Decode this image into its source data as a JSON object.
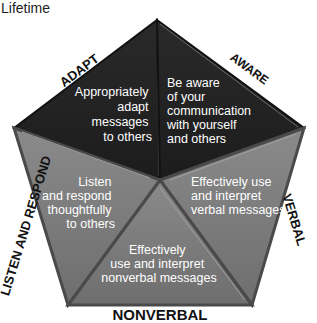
{
  "title": "Lifetime",
  "colors": {
    "dark_segment": "#222222",
    "grey_segment": "#7d7d7d",
    "edge_shadow": "#4a4a4a",
    "segment_text": "#ffffff",
    "label_text": "#111111"
  },
  "segments": [
    {
      "id": "adapt",
      "edge_label": "ADAPT",
      "text_lines": [
        "Appropriately",
        "adapt",
        "messages",
        "to others"
      ]
    },
    {
      "id": "aware",
      "edge_label": "AWARE",
      "text_lines": [
        "Be aware",
        "of your",
        "communication",
        "with yourself",
        "and others"
      ]
    },
    {
      "id": "verbal",
      "edge_label": "VERBAL",
      "text_lines": [
        "Effectively use",
        "and interpret",
        "verbal messages"
      ]
    },
    {
      "id": "nonverbal",
      "edge_label": "NONVERBAL",
      "text_lines": [
        "Effectively",
        "use and interpret",
        "nonverbal messages"
      ]
    },
    {
      "id": "listen",
      "edge_label": "LISTEN AND RESPOND",
      "text_lines": [
        "Listen",
        "and respond",
        "thoughtfully",
        "to others"
      ]
    }
  ]
}
